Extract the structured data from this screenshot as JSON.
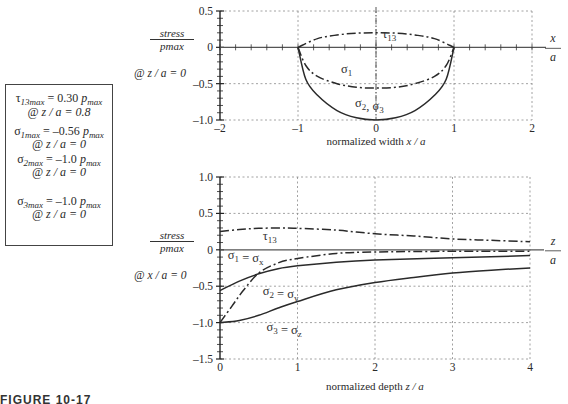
{
  "summary_box": {
    "tau13": {
      "sym": "τ",
      "sub": "13max",
      "value": " = 0.30 ",
      "unit": "p",
      "unit_sub": "max",
      "loc": "@ z / a = 0.8"
    },
    "sigma1": {
      "sym": "σ",
      "sub": "1max",
      "value": " = –0.56 ",
      "unit": "p",
      "unit_sub": "max",
      "loc": "@ z / a = 0"
    },
    "sigma2": {
      "sym": "σ",
      "sub": "2max",
      "value": " = –1.0 ",
      "unit": "p",
      "unit_sub": "max",
      "loc": "@ z / a = 0"
    },
    "sigma3": {
      "sym": "σ",
      "sub": "3max",
      "value": " = –1.0 ",
      "unit": "p",
      "unit_sub": "max",
      "loc": "@ z / a = 0"
    }
  },
  "top_ylabel": {
    "num": "stress",
    "den": "pmax",
    "loc": "@ z / a = 0"
  },
  "bottom_ylabel": {
    "num": "stress",
    "den": "pmax",
    "loc": "@ x / a = 0"
  },
  "caption": "FIGURE 10-17",
  "chart_data": [
    {
      "type": "line",
      "title": "",
      "xlabel": "normalized width  x / a",
      "ylabel": "stress / pmax @ z/a = 0",
      "axis_end_label": "x/a",
      "xlim": [
        -2,
        2
      ],
      "ylim": [
        -1.0,
        0.5
      ],
      "xticks": [
        "-2",
        "-1",
        "0",
        "1",
        "2"
      ],
      "yticks": [
        "0.5",
        "0",
        "-0.5",
        "-1.0"
      ],
      "grid": true,
      "series": [
        {
          "name": "τ13",
          "style": "dash-dot",
          "x": [
            -1,
            -0.75,
            -0.5,
            -0.25,
            0,
            0.25,
            0.5,
            0.75,
            1
          ],
          "y": [
            0,
            0.12,
            0.17,
            0.195,
            0.2,
            0.195,
            0.17,
            0.12,
            0
          ]
        },
        {
          "name": "σ1",
          "style": "dash-dot",
          "x": [
            -1,
            -0.9,
            -0.75,
            -0.5,
            -0.25,
            0,
            0.25,
            0.5,
            0.75,
            0.9,
            1
          ],
          "y": [
            0,
            -0.25,
            -0.4,
            -0.5,
            -0.55,
            -0.56,
            -0.55,
            -0.5,
            -0.4,
            -0.25,
            0
          ]
        },
        {
          "name": "σ2, σ3",
          "style": "solid",
          "x": [
            -1,
            -0.9,
            -0.75,
            -0.5,
            -0.25,
            0,
            0.25,
            0.5,
            0.75,
            0.9,
            1
          ],
          "y": [
            0,
            -0.44,
            -0.66,
            -0.87,
            -0.97,
            -1.0,
            -0.97,
            -0.87,
            -0.66,
            -0.44,
            0
          ]
        }
      ],
      "annotations": [
        "τ13",
        "σ1",
        "σ2, σ3"
      ]
    },
    {
      "type": "line",
      "title": "",
      "xlabel": "normalized depth  z / a",
      "ylabel": "stress / pmax @ x/a = 0",
      "axis_end_label": "z/a",
      "xlim": [
        0,
        4
      ],
      "ylim": [
        -1.5,
        1.0
      ],
      "xticks": [
        "0",
        "1",
        "2",
        "3",
        "4"
      ],
      "yticks": [
        "1.0",
        "0.5",
        "0",
        "-0.5",
        "-1.0",
        "-1.5"
      ],
      "grid": true,
      "series": [
        {
          "name": "τ13",
          "style": "dash-dot",
          "x": [
            0,
            0.25,
            0.5,
            0.8,
            1,
            1.5,
            2,
            2.5,
            3,
            3.5,
            4
          ],
          "y": [
            0.25,
            0.28,
            0.295,
            0.3,
            0.295,
            0.27,
            0.22,
            0.19,
            0.15,
            0.13,
            0.11
          ]
        },
        {
          "name": "σ1 = σx",
          "style": "dash-dot",
          "x": [
            0,
            0.15,
            0.3,
            0.5,
            0.75,
            1,
            1.5,
            2,
            3,
            4
          ],
          "y": [
            -1.0,
            -0.78,
            -0.56,
            -0.32,
            -0.18,
            -0.12,
            -0.05,
            -0.03,
            -0.02,
            -0.02
          ]
        },
        {
          "name": "σ2 = σy",
          "style": "solid",
          "x": [
            0,
            0.25,
            0.5,
            0.75,
            1,
            1.5,
            2,
            3,
            4
          ],
          "y": [
            -0.56,
            -0.43,
            -0.33,
            -0.26,
            -0.22,
            -0.17,
            -0.14,
            -0.11,
            -0.08
          ]
        },
        {
          "name": "σ3 = σz",
          "style": "solid",
          "x": [
            0,
            0.25,
            0.5,
            0.75,
            1,
            1.5,
            2,
            2.5,
            3,
            3.5,
            4
          ],
          "y": [
            -1.0,
            -0.97,
            -0.9,
            -0.8,
            -0.71,
            -0.55,
            -0.45,
            -0.38,
            -0.32,
            -0.28,
            -0.25
          ]
        }
      ],
      "annotations": [
        "τ13",
        "σ1 = σx",
        "σ2 = σy",
        "σ3 = σz"
      ]
    }
  ]
}
